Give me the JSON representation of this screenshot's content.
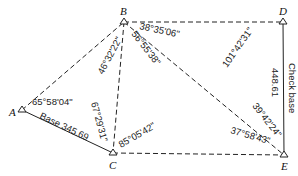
{
  "diagram": {
    "type": "triangulation-network",
    "stations": [
      {
        "id": "A",
        "label": "A"
      },
      {
        "id": "B",
        "label": "B"
      },
      {
        "id": "C",
        "label": "C"
      },
      {
        "id": "D",
        "label": "D"
      },
      {
        "id": "E",
        "label": "E"
      }
    ],
    "lines": [
      {
        "from": "A",
        "to": "B",
        "style": "dashed"
      },
      {
        "from": "A",
        "to": "C",
        "style": "solid",
        "label": "Base 345.69"
      },
      {
        "from": "B",
        "to": "C",
        "style": "dashed"
      },
      {
        "from": "B",
        "to": "D",
        "style": "dashed"
      },
      {
        "from": "B",
        "to": "E",
        "style": "dashed"
      },
      {
        "from": "C",
        "to": "E",
        "style": "dashed"
      },
      {
        "from": "D",
        "to": "E",
        "style": "solid",
        "label": "Check base 448.61"
      }
    ],
    "angles": {
      "A_BAC": "65°58'04\"",
      "B_ABC": "46°32'22\"",
      "B_CBE": "56°55'38\"",
      "B_EBD": "38°35'06\"",
      "C_ACB": "67°29'31\"",
      "C_BCE": "85°05'42\"",
      "D_BDE": "101°42'31\"",
      "E_DEB": "39°42'24\"",
      "E_BEC": "37°58'43\""
    },
    "base_label": "Base",
    "base_length": "345.69",
    "check_base_label": "Check base",
    "check_base_length": "448.61"
  }
}
